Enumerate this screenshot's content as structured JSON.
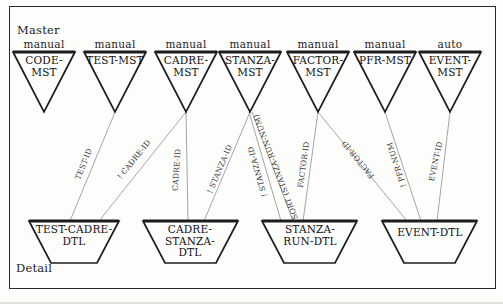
{
  "labels": {
    "master": "Master",
    "detail": "Detail"
  },
  "masters": [
    {
      "name": "CODE-MST",
      "mode": "manual"
    },
    {
      "name": "TEST-MST",
      "mode": "manual"
    },
    {
      "name": "CADRE-MST",
      "mode": "manual"
    },
    {
      "name": "STANZA-MST",
      "mode": "manual"
    },
    {
      "name": "FACTOR-MST",
      "mode": "manual"
    },
    {
      "name": "PFR-MST",
      "mode": "manual"
    },
    {
      "name": "EVENT-MST",
      "mode": "auto"
    }
  ],
  "details": [
    {
      "name": "TEST-CADRE-DTL"
    },
    {
      "name": "CADRE-STANZA-DTL"
    },
    {
      "name": "STANZA-RUN-DTL"
    },
    {
      "name": "EVENT-DTL"
    }
  ],
  "links": [
    {
      "from": "TEST-MST",
      "to": "TEST-CADRE-DTL",
      "label": "TEST-ID"
    },
    {
      "from": "CADRE-MST",
      "to": "TEST-CADRE-DTL",
      "label": "! CADRE-ID"
    },
    {
      "from": "CADRE-MST",
      "to": "CADRE-STANZA-DTL",
      "label": "CADRE-ID"
    },
    {
      "from": "STANZA-MST",
      "to": "CADRE-STANZA-DTL",
      "label": "! STANZA-ID"
    },
    {
      "from": "STANZA-MST",
      "to": "STANZA-RUN-DTL",
      "label": "! STANZA-ID"
    },
    {
      "from": "STANZA-MST",
      "to": "STANZA-RUN-DTL",
      "label": "SORT (STANZA-RUN-NUM)"
    },
    {
      "from": "FACTOR-MST",
      "to": "STANZA-RUN-DTL",
      "label": "FACTOR-ID"
    },
    {
      "from": "FACTOR-MST",
      "to": "EVENT-DTL",
      "label": "FACTOR-ID"
    },
    {
      "from": "PFR-MST",
      "to": "EVENT-DTL",
      "label": "! PFR-NUM"
    },
    {
      "from": "EVENT-MST",
      "to": "EVENT-DTL",
      "label": "EVENT-ID"
    }
  ],
  "colors": {
    "shape_stroke": "#1c1c1c",
    "connector": "#9b9b9b",
    "background": "#fdfdfc"
  }
}
